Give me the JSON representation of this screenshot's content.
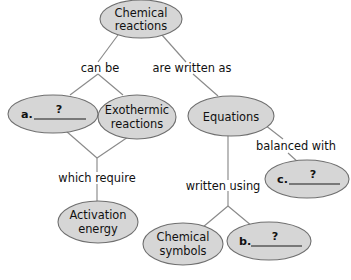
{
  "diagram": {
    "type": "concept-map",
    "title_node": "Chemical reactions",
    "colors": {
      "node_fill": "#d6d6d6",
      "node_stroke": "#6f6f6f",
      "connector": "#8a8a8a",
      "text": "#111111",
      "background": "#ffffff"
    },
    "nodes": [
      {
        "id": "chemical-reactions",
        "kind": "text",
        "line1": "Chemical",
        "line2": "reactions"
      },
      {
        "id": "blank-a",
        "kind": "blank",
        "letter": "a.",
        "question": "?"
      },
      {
        "id": "exothermic-reactions",
        "kind": "text",
        "line1": "Exothermic",
        "line2": "reactions"
      },
      {
        "id": "equations",
        "kind": "text",
        "line1": "Equations",
        "line2": ""
      },
      {
        "id": "blank-c",
        "kind": "blank",
        "letter": "c.",
        "question": "?"
      },
      {
        "id": "activation-energy",
        "kind": "text",
        "line1": "Activation",
        "line2": "energy"
      },
      {
        "id": "chemical-symbols",
        "kind": "text",
        "line1": "Chemical",
        "line2": "symbols"
      },
      {
        "id": "blank-b",
        "kind": "blank",
        "letter": "b.",
        "question": "?"
      }
    ],
    "links": [
      {
        "id": "can-be",
        "label": "can be"
      },
      {
        "id": "are-written-as",
        "label": "are written as"
      },
      {
        "id": "which-require",
        "label": "which require"
      },
      {
        "id": "written-using",
        "label": "written using"
      },
      {
        "id": "balanced-with",
        "label": "balanced with"
      }
    ]
  }
}
